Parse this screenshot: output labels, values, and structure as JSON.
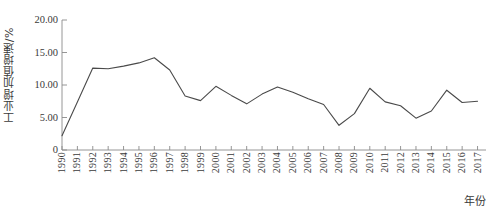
{
  "chart_data": {
    "type": "line",
    "title": "",
    "subtitle": "",
    "xlabel": "年份",
    "ylabel": "工业增加值增速/%",
    "grid": false,
    "legend": null,
    "legend_position": "none",
    "xlim": [
      1990,
      2017
    ],
    "ylim": [
      0,
      20
    ],
    "y_ticks": [
      0,
      5,
      10,
      15,
      20
    ],
    "y_tick_labels": [
      "0",
      "5.00",
      "10.00",
      "15.00",
      "20.00"
    ],
    "categories": [
      "1990",
      "1991",
      "1992",
      "1993",
      "1994",
      "1995",
      "1996",
      "1997",
      "1998",
      "1999",
      "2000",
      "2001",
      "2002",
      "2003",
      "2004",
      "2005",
      "2006",
      "2007",
      "2008",
      "2009",
      "2010",
      "2011",
      "2012",
      "2013",
      "2014",
      "2015",
      "2016",
      "2017"
    ],
    "x": [
      1990,
      1991,
      1992,
      1993,
      1994,
      1995,
      1996,
      1997,
      1998,
      1999,
      2000,
      2001,
      2002,
      2003,
      2004,
      2005,
      2006,
      2007,
      2008,
      2009,
      2010,
      2011,
      2012,
      2013,
      2014,
      2015,
      2016,
      2017
    ],
    "series": [
      {
        "name": "工业增加值增速",
        "color": "#4a4a4a",
        "values": [
          2.2,
          7.4,
          12.6,
          12.5,
          12.9,
          13.4,
          14.2,
          12.3,
          8.3,
          7.6,
          9.8,
          8.4,
          7.1,
          8.6,
          9.7,
          8.9,
          7.9,
          7.0,
          3.8,
          5.6,
          9.5,
          7.4,
          6.8,
          4.9,
          6.0,
          9.2,
          7.3,
          7.5
        ]
      }
    ],
    "values": [
      2.2,
      7.4,
      12.6,
      12.5,
      12.9,
      13.4,
      14.2,
      12.3,
      8.3,
      7.6,
      9.8,
      8.4,
      7.1,
      8.6,
      9.7,
      8.9,
      7.9,
      7.0,
      3.8,
      5.6,
      9.5,
      7.4,
      6.8,
      4.9,
      6.0,
      9.2,
      7.3,
      7.5
    ],
    "annotations": []
  },
  "axes": {
    "y_title": "工业增加值增速/%",
    "x_title": "年份"
  },
  "colors": {
    "line": "#4a4a4a",
    "axis": "#8a8a8a",
    "text": "#3a3a3a",
    "background": "#ffffff"
  }
}
